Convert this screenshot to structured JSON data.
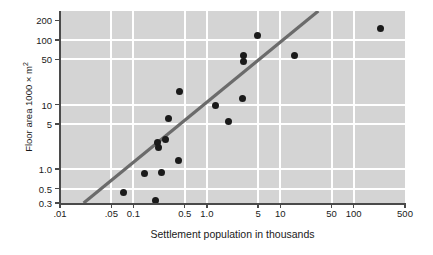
{
  "chart_data": {
    "type": "scatter",
    "title": "",
    "xlabel": "Settlement population in thousands",
    "ylabel": "Floor area 1000 × m²",
    "ylabel_base": "Floor area 1000 × m",
    "ylabel_sup": "2",
    "xscale": "log",
    "yscale": "log",
    "xlim": [
      0.01,
      500
    ],
    "ylim": [
      0.3,
      280
    ],
    "grid": true,
    "legend": null,
    "xticks": [
      {
        "value": 0.01,
        "label": ".01"
      },
      {
        "value": 0.05,
        "label": ".05"
      },
      {
        "value": 0.1,
        "label": "0.1"
      },
      {
        "value": 0.5,
        "label": "0.5"
      },
      {
        "value": 1.0,
        "label": "1.0"
      },
      {
        "value": 5,
        "label": "5"
      },
      {
        "value": 10,
        "label": "10"
      },
      {
        "value": 50,
        "label": "50"
      },
      {
        "value": 100,
        "label": "100"
      },
      {
        "value": 500,
        "label": "500"
      }
    ],
    "yticks": [
      {
        "value": 200,
        "label": "200"
      },
      {
        "value": 100,
        "label": "100"
      },
      {
        "value": 50,
        "label": "50"
      },
      {
        "value": 10,
        "label": "10"
      },
      {
        "value": 5,
        "label": "5"
      },
      {
        "value": 1.0,
        "label": "1.0"
      },
      {
        "value": 0.5,
        "label": "0.5"
      },
      {
        "value": 0.3,
        "label": "0.3"
      }
    ],
    "gridlines_x": [
      0.05,
      0.1,
      0.5,
      1.0,
      5,
      10,
      50,
      100
    ],
    "gridlines_y": [
      100,
      50,
      10,
      5,
      1.0,
      0.5
    ],
    "points": [
      {
        "x": 0.073,
        "y": 0.44
      },
      {
        "x": 0.14,
        "y": 0.85
      },
      {
        "x": 0.2,
        "y": 0.33
      },
      {
        "x": 0.215,
        "y": 2.6
      },
      {
        "x": 0.22,
        "y": 2.2
      },
      {
        "x": 0.245,
        "y": 0.88
      },
      {
        "x": 0.275,
        "y": 2.9
      },
      {
        "x": 0.3,
        "y": 6.0
      },
      {
        "x": 0.41,
        "y": 1.35
      },
      {
        "x": 0.42,
        "y": 16.0
      },
      {
        "x": 1.3,
        "y": 9.5
      },
      {
        "x": 2.0,
        "y": 5.4
      },
      {
        "x": 3.1,
        "y": 12.5
      },
      {
        "x": 3.15,
        "y": 57.0
      },
      {
        "x": 3.2,
        "y": 46.0
      },
      {
        "x": 4.9,
        "y": 115.0
      },
      {
        "x": 15.5,
        "y": 57.0
      },
      {
        "x": 230.0,
        "y": 150.0
      }
    ],
    "trend_line": {
      "x_start": 0.021,
      "y_start": 0.3,
      "x_end": 33.0,
      "y_end": 280.0,
      "color": "#6b6b6b"
    },
    "colors": {
      "plot_background": "#d4d4d4",
      "grid": "#ffffff",
      "point": "#1a1a1a",
      "axis": "#4a4a4a",
      "text": "#1a1a1a"
    }
  }
}
